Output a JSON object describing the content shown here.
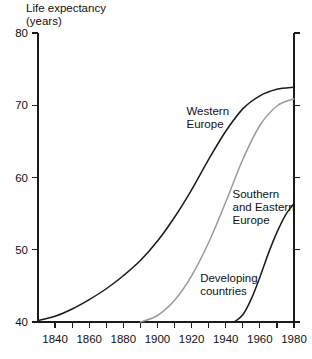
{
  "chart_data": {
    "type": "line",
    "title": "Life expectancy",
    "subtitle": "(years)",
    "ylabel": "Life expectancy (years)",
    "xlabel": "",
    "xlim": [
      1830,
      1980
    ],
    "ylim": [
      40,
      80
    ],
    "grid": false,
    "legend_position": "inline-annotations",
    "x_tick_labels": [
      "1840",
      "1860",
      "1880",
      "1900",
      "1920",
      "1940",
      "1960",
      "1980"
    ],
    "x_labeled_ticks": [
      1840,
      1860,
      1880,
      1900,
      1920,
      1940,
      1960,
      1980
    ],
    "x_minor_ticks": [
      1830,
      1850,
      1870,
      1890,
      1910,
      1930,
      1950,
      1970
    ],
    "y_tick_labels": [
      "40",
      "50",
      "60",
      "70",
      "80"
    ],
    "y_ticks": [
      40,
      50,
      60,
      70,
      80
    ],
    "series": [
      {
        "name": "Western Europe",
        "color": "#1a1a1a",
        "label_x": 1917,
        "label_y": 68.6,
        "x": [
          1830,
          1840,
          1850,
          1860,
          1870,
          1880,
          1890,
          1900,
          1910,
          1920,
          1930,
          1940,
          1950,
          1960,
          1970,
          1980
        ],
        "y": [
          40.2,
          40.8,
          41.8,
          43.1,
          44.6,
          46.4,
          48.5,
          51.2,
          54.5,
          58.3,
          62.5,
          66.4,
          69.5,
          71.3,
          72.2,
          72.5
        ]
      },
      {
        "name": "Southern and Eastern Europe",
        "color": "#9a9a9a",
        "label_x": 1944,
        "label_y": 57.2,
        "x": [
          1890,
          1900,
          1910,
          1920,
          1930,
          1940,
          1950,
          1960,
          1970,
          1980
        ],
        "y": [
          40.0,
          40.9,
          43.0,
          46.4,
          51.0,
          56.6,
          62.5,
          67.2,
          69.9,
          70.9
        ]
      },
      {
        "name": "Developing countries",
        "color": "#1a1a1a",
        "label_x": 1925,
        "label_y": 45.6,
        "x": [
          1945,
          1950,
          1955,
          1960,
          1965,
          1970,
          1975,
          1980
        ],
        "y": [
          40.0,
          41.0,
          43.2,
          46.2,
          49.5,
          52.4,
          54.8,
          56.4
        ]
      }
    ]
  }
}
